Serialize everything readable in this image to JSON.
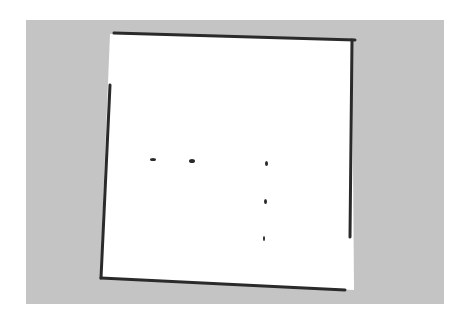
{
  "map": {
    "type": "occupancy-grid",
    "colors": {
      "page_background": "#ffffff",
      "unknown": "#c4c4c4",
      "free": "#ffffff",
      "occupied": "#2a2a2a"
    },
    "unknown_region": {
      "x": 26,
      "y": 20,
      "width": 418,
      "height": 284
    },
    "free_region": [
      [
        110,
        34
      ],
      [
        352,
        40
      ],
      [
        354,
        290
      ],
      [
        100,
        278
      ]
    ],
    "walls": [
      {
        "name": "top-wall",
        "points": [
          [
            114,
            33
          ],
          [
            355,
            40
          ]
        ]
      },
      {
        "name": "right-wall",
        "points": [
          [
            352,
            40
          ],
          [
            350,
            237
          ]
        ]
      },
      {
        "name": "bottom-wall",
        "points": [
          [
            101,
            278
          ],
          [
            345,
            290
          ]
        ]
      },
      {
        "name": "left-wall",
        "points": [
          [
            110,
            85
          ],
          [
            101,
            278
          ]
        ]
      }
    ],
    "obstacles": [
      {
        "name": "obstacle-1",
        "x": 150,
        "y": 158,
        "w": 6,
        "h": 3
      },
      {
        "name": "obstacle-2",
        "x": 189,
        "y": 159,
        "w": 6,
        "h": 4
      },
      {
        "name": "obstacle-3",
        "x": 265,
        "y": 161,
        "w": 3,
        "h": 5
      },
      {
        "name": "obstacle-4",
        "x": 264,
        "y": 199,
        "w": 3,
        "h": 5
      },
      {
        "name": "obstacle-5",
        "x": 263,
        "y": 236,
        "w": 2,
        "h": 5
      }
    ]
  }
}
